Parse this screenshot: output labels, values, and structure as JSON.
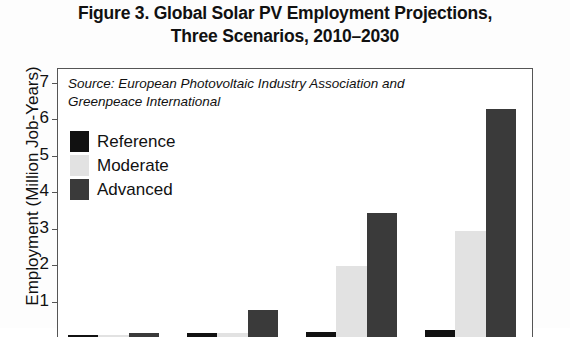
{
  "title": {
    "line1": "Figure 3. Global Solar PV Employment Projections,",
    "line2": "Three Scenarios, 2010–2030"
  },
  "source_note": {
    "line1": "Source: European Photovoltaic Industry Association",
    "line2": "and Greenpeace International"
  },
  "legend": {
    "items": [
      {
        "label": "Reference",
        "color": "#111111"
      },
      {
        "label": "Moderate",
        "color": "#e2e2e2"
      },
      {
        "label": "Advanced",
        "color": "#3a3a3a"
      }
    ]
  },
  "axis": {
    "ylabel": "Employment (Million Job-Years)",
    "yticks": [
      "7",
      "6",
      "5",
      "4",
      "3",
      "2",
      "1"
    ]
  },
  "chart_data": {
    "type": "bar",
    "title": "Figure 3. Global Solar PV Employment Projections, Three Scenarios, 2010–2030",
    "xlabel": "",
    "ylabel": "Employment (Million Job-Years)",
    "ylim": [
      0,
      7
    ],
    "ytick_values": [
      1,
      2,
      3,
      4,
      5,
      6,
      7
    ],
    "grid": false,
    "legend_position": "upper-left-inside",
    "categories": [
      "2010",
      "2015",
      "2020",
      "2030"
    ],
    "series": [
      {
        "name": "Reference",
        "color": "#111111",
        "values": [
          0.05,
          0.1,
          0.15,
          0.2
        ]
      },
      {
        "name": "Moderate",
        "color": "#e2e2e2",
        "values": [
          0.05,
          0.1,
          1.95,
          2.9
        ]
      },
      {
        "name": "Advanced",
        "color": "#3a3a3a",
        "values": [
          0.1,
          0.75,
          3.4,
          6.25
        ]
      }
    ],
    "note": "Category axis labels are cropped below the visible image area; bottom axis line and 0 baseline fall outside the screenshot."
  }
}
